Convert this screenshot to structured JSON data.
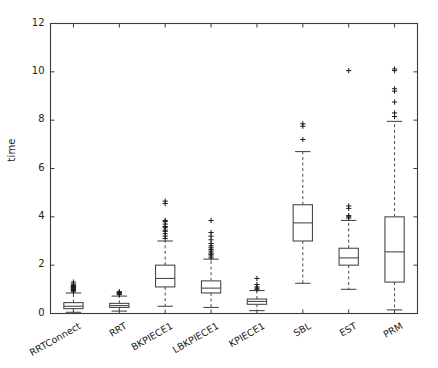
{
  "figure": {
    "background": "#ffffff",
    "axis_color": "#3a3a3a",
    "line_color": "#4a4a4a",
    "box_fill": "#ffffff"
  },
  "chart_data": {
    "type": "box",
    "title": "",
    "xlabel": "",
    "ylabel": "time",
    "ylim": [
      0,
      12
    ],
    "yticks": [
      0,
      2,
      4,
      6,
      8,
      10,
      12
    ],
    "ytick_labels": [
      "0",
      "2",
      "4",
      "6",
      "8",
      "10",
      "12"
    ],
    "grid": false,
    "legend": null,
    "categories": [
      "RRTConnect",
      "RRT",
      "BKPIECE1",
      "LBKPIECE1",
      "KPIECE1",
      "SBL",
      "EST",
      "PRM"
    ],
    "boxes": [
      {
        "label": "RRTConnect",
        "whisker_low": 0.05,
        "q1": 0.2,
        "median": 0.3,
        "q3": 0.45,
        "whisker_high": 0.85,
        "outliers": [
          0.9,
          0.95,
          0.98,
          1.0,
          1.02,
          1.05,
          1.08,
          1.1,
          1.12,
          1.15,
          1.18,
          1.22,
          1.3
        ]
      },
      {
        "label": "RRT",
        "whisker_low": 0.1,
        "q1": 0.25,
        "median": 0.33,
        "q3": 0.42,
        "whisker_high": 0.72,
        "outliers": [
          0.78,
          0.82,
          0.85,
          0.88,
          0.9
        ]
      },
      {
        "label": "BKPIECE1",
        "whisker_low": 0.3,
        "q1": 1.1,
        "median": 1.45,
        "q3": 2.0,
        "whisker_high": 3.0,
        "outliers": [
          3.1,
          3.2,
          3.3,
          3.4,
          3.45,
          3.55,
          3.6,
          3.7,
          3.8,
          3.85,
          4.55,
          4.65
        ]
      },
      {
        "label": "LBKPIECE1",
        "whisker_low": 0.25,
        "q1": 0.85,
        "median": 1.05,
        "q3": 1.35,
        "whisker_high": 2.25,
        "outliers": [
          2.3,
          2.38,
          2.45,
          2.5,
          2.58,
          2.65,
          2.72,
          2.8,
          2.9,
          3.05,
          3.2,
          3.35,
          3.85
        ]
      },
      {
        "label": "KPIECE1",
        "whisker_low": 0.12,
        "q1": 0.38,
        "median": 0.5,
        "q3": 0.6,
        "whisker_high": 0.95,
        "outliers": [
          1.0,
          1.05,
          1.1,
          1.2,
          1.45
        ]
      },
      {
        "label": "SBL",
        "whisker_low": 1.25,
        "q1": 3.0,
        "median": 3.75,
        "q3": 4.5,
        "whisker_high": 6.7,
        "outliers": [
          7.2,
          7.75,
          7.85
        ]
      },
      {
        "label": "EST",
        "whisker_low": 1.0,
        "q1": 2.0,
        "median": 2.3,
        "q3": 2.7,
        "whisker_high": 3.85,
        "outliers": [
          3.95,
          4.0,
          4.05,
          4.35,
          4.45,
          10.05
        ]
      },
      {
        "label": "PRM",
        "whisker_low": 0.15,
        "q1": 1.3,
        "median": 2.55,
        "q3": 4.0,
        "whisker_high": 7.95,
        "outliers": [
          8.15,
          8.3,
          8.75,
          9.2,
          9.3,
          10.05,
          10.12
        ]
      }
    ]
  }
}
